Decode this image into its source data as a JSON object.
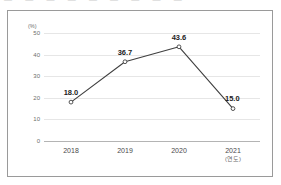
{
  "top_sliver": {
    "text": "—  —   — —  —  —   —  —  —"
  },
  "chart_data": {
    "type": "line",
    "title": "",
    "subtitle": "",
    "xlabel": "(연도)",
    "ylabel": "(%)",
    "categories": [
      "2018",
      "2019",
      "2020",
      "2021"
    ],
    "values": [
      18.0,
      36.7,
      43.6,
      15.0
    ],
    "point_labels": [
      "18.0",
      "36.7",
      "43.6",
      "15.0"
    ],
    "series": [
      {
        "name": "",
        "values": [
          18.0,
          36.7,
          43.6,
          15.0
        ]
      }
    ],
    "ylim": [
      0,
      50
    ],
    "yticks": [
      0,
      10,
      20,
      30,
      40,
      50
    ],
    "ytick_labels": [
      "0",
      "10",
      "20",
      "30",
      "40",
      "50"
    ],
    "grid": true,
    "legend": "none",
    "marker": "open-circle",
    "colors": {
      "line": "#3f3f3f",
      "marker_fill": "#ffffff",
      "marker_stroke": "#3f3f3f",
      "gridline": "#e6e6e6",
      "axis": "#b4b4b4",
      "frame_border": "#9a9a9a",
      "label_text": "#1c1c1c",
      "tick_text": "#6d6d6d",
      "background": "#ffffff"
    }
  }
}
